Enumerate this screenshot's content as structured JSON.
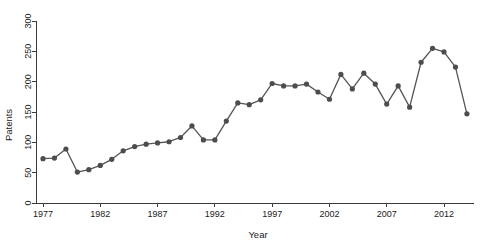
{
  "chart_data": {
    "type": "line",
    "title": "",
    "subtitle": "",
    "xlabel": "Year",
    "ylabel": "Patents",
    "xlim": [
      1976.2,
      2014.6
    ],
    "ylim": [
      0,
      315
    ],
    "grid": false,
    "legend": false,
    "legend_position": "none",
    "marker": "circle",
    "line_color": "#555555",
    "marker_color": "#4d4d4d",
    "axis_color": "#3a3a3a",
    "background_color": "#ffffff",
    "xticks": [
      1977,
      1982,
      1987,
      1992,
      1997,
      2002,
      2007,
      2012
    ],
    "xtick_labels": [
      "1977",
      "1982",
      "1987",
      "1992",
      "1997",
      "2002",
      "2007",
      "2012"
    ],
    "yticks": [
      0,
      50,
      100,
      150,
      200,
      250,
      300
    ],
    "ytick_labels": [
      "0",
      "50",
      "100",
      "150",
      "200",
      "250",
      "300"
    ],
    "x": [
      1977,
      1978,
      1979,
      1980,
      1981,
      1982,
      1983,
      1984,
      1985,
      1986,
      1987,
      1988,
      1989,
      1990,
      1991,
      1992,
      1993,
      1994,
      1995,
      1996,
      1997,
      1998,
      1999,
      2000,
      2001,
      2002,
      2003,
      2004,
      2005,
      2006,
      2007,
      2008,
      2009,
      2010,
      2011,
      2012,
      2013,
      2014
    ],
    "values": [
      73,
      74,
      89,
      51,
      55,
      62,
      72,
      86,
      93,
      97,
      99,
      101,
      108,
      127,
      104,
      104,
      135,
      165,
      162,
      170,
      197,
      193,
      193,
      196,
      183,
      171,
      193,
      183,
      214,
      188,
      214,
      152,
      183,
      158,
      232,
      255,
      249,
      224
    ],
    "series": [
      {
        "name": "Patents",
        "values": [
          73,
          74,
          89,
          51,
          55,
          62,
          72,
          86,
          93,
          97,
          99,
          101,
          108,
          127,
          104,
          104,
          135,
          165,
          162,
          170,
          197,
          193,
          193,
          196,
          183,
          171,
          193,
          183,
          214,
          188,
          214,
          152,
          183,
          158,
          232,
          255,
          249,
          224
        ]
      }
    ],
    "points": [
      {
        "x": 1977,
        "y": 73
      },
      {
        "x": 1978,
        "y": 74
      },
      {
        "x": 1979,
        "y": 89
      },
      {
        "x": 1980,
        "y": 51
      },
      {
        "x": 1981,
        "y": 55
      },
      {
        "x": 1982,
        "y": 62
      },
      {
        "x": 1983,
        "y": 72
      },
      {
        "x": 1984,
        "y": 86
      },
      {
        "x": 1985,
        "y": 93
      },
      {
        "x": 1986,
        "y": 97
      },
      {
        "x": 1987,
        "y": 99
      },
      {
        "x": 1988,
        "y": 101
      },
      {
        "x": 1989,
        "y": 108
      },
      {
        "x": 1990,
        "y": 127
      },
      {
        "x": 1991,
        "y": 104
      },
      {
        "x": 1992,
        "y": 104
      },
      {
        "x": 1993,
        "y": 135
      },
      {
        "x": 1994,
        "y": 165
      },
      {
        "x": 1995,
        "y": 162
      },
      {
        "x": 1996,
        "y": 170
      },
      {
        "x": 1997,
        "y": 197
      },
      {
        "x": 1998,
        "y": 193
      },
      {
        "x": 1999,
        "y": 193
      },
      {
        "x": 2000,
        "y": 196
      },
      {
        "x": 2001,
        "y": 183
      },
      {
        "x": 2002,
        "y": 171
      },
      {
        "x": 2003,
        "y": 212
      },
      {
        "x": 2004,
        "y": 188
      },
      {
        "x": 2005,
        "y": 214
      },
      {
        "x": 2006,
        "y": 196
      },
      {
        "x": 2007,
        "y": 163
      },
      {
        "x": 2008,
        "y": 193
      },
      {
        "x": 2009,
        "y": 158
      },
      {
        "x": 2010,
        "y": 232
      },
      {
        "x": 2011,
        "y": 255
      },
      {
        "x": 2012,
        "y": 249
      },
      {
        "x": 2013,
        "y": 224
      },
      {
        "x": 2014,
        "y": 147
      }
    ]
  }
}
